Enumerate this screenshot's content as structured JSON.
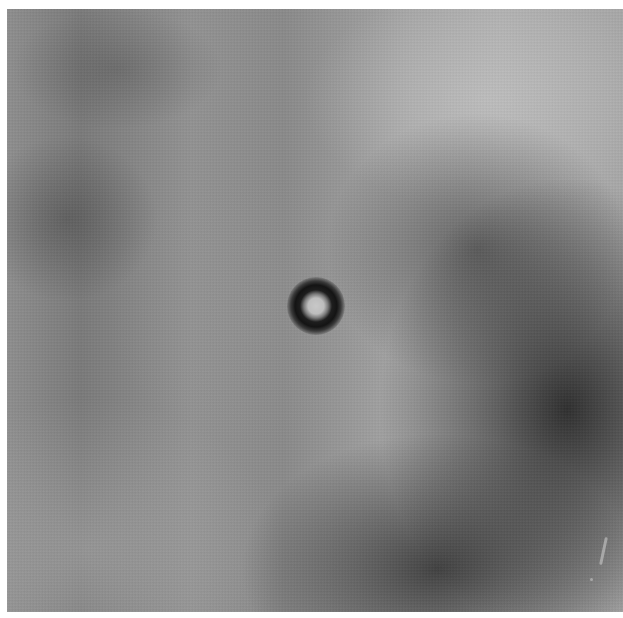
{
  "image": {
    "description": "Grayscale micrograph-like photo with a dark ring-shaped particle at center",
    "colors": {
      "background_mid": "#8a8a8a",
      "light_region": "#b0b0b0",
      "dark_region": "#1e1e1e",
      "particle_ring": "#141414",
      "particle_core": "#c8c8c8"
    }
  }
}
